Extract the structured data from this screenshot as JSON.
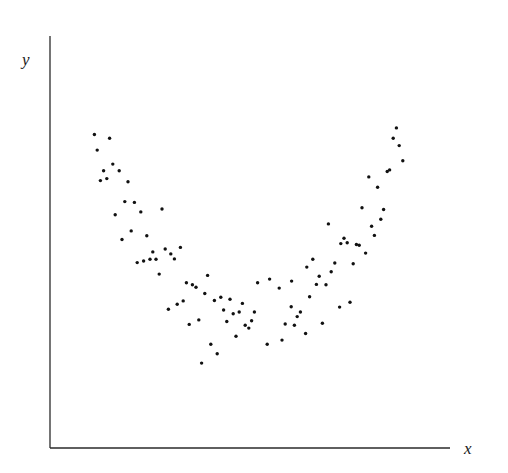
{
  "chart_data": {
    "type": "scatter",
    "title": "",
    "xlabel": "x",
    "ylabel": "y",
    "xlim": [
      0,
      100
    ],
    "ylim": [
      0,
      100
    ],
    "grid": false,
    "legend": null,
    "ticks": "none",
    "marker_color": "#111111",
    "series": [
      {
        "name": "observations",
        "points": [
          [
            11.1,
            76.1
          ],
          [
            14.9,
            75.2
          ],
          [
            11.8,
            72.3
          ],
          [
            15.7,
            68.9
          ],
          [
            13.4,
            67.3
          ],
          [
            17.3,
            67.3
          ],
          [
            12.6,
            64.9
          ],
          [
            14.2,
            65.4
          ],
          [
            19.5,
            64.6
          ],
          [
            18.7,
            59.8
          ],
          [
            21.1,
            59.6
          ],
          [
            22.7,
            57.3
          ],
          [
            16.3,
            56.6
          ],
          [
            28.0,
            58.0
          ],
          [
            20.3,
            52.7
          ],
          [
            18.0,
            50.6
          ],
          [
            24.2,
            51.5
          ],
          [
            25.7,
            47.6
          ],
          [
            28.8,
            48.3
          ],
          [
            32.6,
            48.7
          ],
          [
            30.2,
            47.1
          ],
          [
            31.1,
            45.9
          ],
          [
            21.8,
            45.0
          ],
          [
            23.4,
            45.4
          ],
          [
            25.0,
            45.8
          ],
          [
            26.5,
            45.8
          ],
          [
            27.3,
            42.2
          ],
          [
            39.4,
            41.9
          ],
          [
            34.1,
            40.1
          ],
          [
            35.6,
            39.6
          ],
          [
            36.5,
            39.0
          ],
          [
            51.9,
            40.1
          ],
          [
            38.7,
            37.5
          ],
          [
            41.1,
            35.8
          ],
          [
            42.7,
            36.6
          ],
          [
            45.0,
            36.1
          ],
          [
            33.3,
            35.7
          ],
          [
            31.8,
            34.9
          ],
          [
            29.6,
            33.7
          ],
          [
            48.1,
            35.1
          ],
          [
            43.4,
            33.5
          ],
          [
            45.8,
            32.6
          ],
          [
            47.3,
            33.0
          ],
          [
            51.1,
            33.0
          ],
          [
            44.2,
            30.7
          ],
          [
            37.2,
            31.1
          ],
          [
            34.8,
            30.0
          ],
          [
            50.4,
            30.9
          ],
          [
            48.8,
            29.8
          ],
          [
            49.7,
            29.1
          ],
          [
            46.5,
            27.1
          ],
          [
            40.2,
            25.2
          ],
          [
            41.8,
            22.9
          ],
          [
            37.9,
            20.6
          ],
          [
            78.9,
            47.3
          ],
          [
            65.7,
            45.8
          ],
          [
            71.2,
            44.9
          ],
          [
            75.8,
            44.7
          ],
          [
            64.2,
            43.9
          ],
          [
            70.3,
            42.8
          ],
          [
            67.3,
            41.7
          ],
          [
            54.9,
            41.0
          ],
          [
            60.4,
            40.5
          ],
          [
            66.6,
            39.7
          ],
          [
            69.0,
            39.6
          ],
          [
            57.3,
            38.8
          ],
          [
            64.9,
            36.7
          ],
          [
            60.3,
            34.3
          ],
          [
            72.4,
            34.2
          ],
          [
            75.0,
            35.4
          ],
          [
            62.6,
            33.0
          ],
          [
            61.8,
            31.9
          ],
          [
            58.8,
            30.1
          ],
          [
            61.1,
            29.8
          ],
          [
            68.1,
            30.3
          ],
          [
            63.9,
            27.8
          ],
          [
            58.0,
            26.2
          ],
          [
            54.3,
            25.2
          ],
          [
            86.6,
            77.7
          ],
          [
            85.8,
            75.2
          ],
          [
            87.3,
            73.4
          ],
          [
            88.2,
            69.7
          ],
          [
            84.3,
            67.1
          ],
          [
            84.9,
            67.5
          ],
          [
            79.7,
            65.8
          ],
          [
            81.9,
            63.3
          ],
          [
            78.0,
            58.3
          ],
          [
            83.4,
            57.9
          ],
          [
            82.7,
            55.5
          ],
          [
            69.6,
            54.4
          ],
          [
            80.4,
            53.8
          ],
          [
            81.1,
            51.6
          ],
          [
            73.5,
            50.9
          ],
          [
            72.7,
            49.6
          ],
          [
            74.3,
            49.8
          ],
          [
            76.6,
            49.4
          ],
          [
            77.3,
            49.2
          ]
        ]
      }
    ]
  },
  "labels": {
    "x": "x",
    "y": "y"
  },
  "plot_area_px": {
    "left": 50,
    "right": 450,
    "top": 36,
    "bottom": 448
  }
}
